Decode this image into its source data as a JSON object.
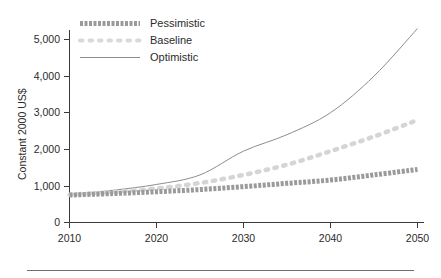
{
  "chart_data": {
    "type": "line",
    "title": "",
    "subtitle": "",
    "xlabel": "",
    "ylabel": "Constant 2000 US$",
    "x": [
      2010,
      2015,
      2020,
      2025,
      2030,
      2035,
      2040,
      2045,
      2050
    ],
    "xlim": [
      2010,
      2050
    ],
    "ylim": [
      0,
      5600
    ],
    "x_ticks": [
      "2010",
      "2020",
      "2030",
      "2040",
      "2050"
    ],
    "x_tick_values": [
      2010,
      2020,
      2030,
      2040,
      2050
    ],
    "y_ticks": [
      "0",
      "1,000",
      "2,000",
      "3,000",
      "4,000",
      "5,000"
    ],
    "y_tick_values": [
      0,
      1000,
      2000,
      3000,
      4000,
      5000
    ],
    "grid": false,
    "legend_position": "top-left",
    "series": [
      {
        "name": "Pessimistic",
        "style": "thick-dashed",
        "color": "#9a9a9a",
        "values": [
          750,
          790,
          840,
          900,
          980,
          1070,
          1160,
          1300,
          1450
        ]
      },
      {
        "name": "Baseline",
        "style": "dotted",
        "color": "#d5d5d5",
        "values": [
          760,
          830,
          930,
          1080,
          1300,
          1580,
          1950,
          2350,
          2800
        ]
      },
      {
        "name": "Optimistic",
        "style": "thin-solid",
        "color": "#8d8d8d",
        "values": [
          770,
          880,
          1040,
          1300,
          1950,
          2400,
          3000,
          4000,
          5300
        ]
      }
    ]
  },
  "legend": {
    "items": [
      {
        "label": "Pessimistic",
        "swatch": "thick-dashed-swatch",
        "color": "#9a9a9a"
      },
      {
        "label": "Baseline",
        "swatch": "dotted-swatch",
        "color": "#d9d9d9"
      },
      {
        "label": "Optimistic",
        "swatch": "thin-line-swatch",
        "color": "#8d8d8d"
      }
    ]
  },
  "axis": {
    "y_title": "Constant 2000 US$"
  },
  "colors": {
    "axis": "#3a3a3a",
    "text": "#2b2b2b",
    "footer_rule": "#6f6f6f",
    "pessimistic": "#9a9a9a",
    "baseline": "#d5d5d5",
    "optimistic": "#8d8d8d"
  }
}
